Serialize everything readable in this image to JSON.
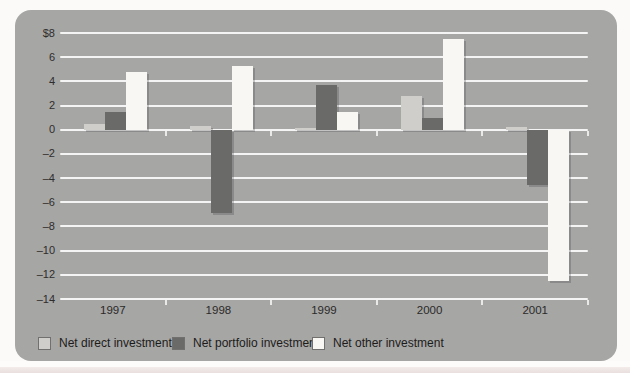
{
  "page": {
    "background": "#fbfaf9",
    "bottom_strip_color": "#e8dfde"
  },
  "panel": {
    "background": "#a6a6a5"
  },
  "chart_data": {
    "type": "bar",
    "title": "",
    "xlabel": "",
    "ylabel": "",
    "categories": [
      "1997",
      "1998",
      "1999",
      "2000",
      "2001"
    ],
    "series": [
      {
        "name": "Net direct investment",
        "color": "#cfcecb",
        "values": [
          0.5,
          0.3,
          0.1,
          2.8,
          0.2
        ]
      },
      {
        "name": "Net portfolio investment",
        "color": "#6a6a69",
        "values": [
          1.5,
          -6.9,
          3.7,
          1.0,
          -4.6
        ]
      },
      {
        "name": "Net other investment",
        "color": "#f8f7f4",
        "values": [
          4.8,
          5.3,
          1.5,
          7.5,
          -12.5
        ]
      }
    ],
    "y_axis": {
      "unit": "$ (billions implied by $8 top label)",
      "ylim": [
        -14,
        8
      ],
      "tick_step": 2,
      "gridlines": true,
      "gridline_color": "#ffffff",
      "ticks": [
        {
          "label": "$8",
          "value": 8
        },
        {
          "label": "6",
          "value": 6
        },
        {
          "label": "4",
          "value": 4
        },
        {
          "label": "2",
          "value": 2
        },
        {
          "label": "0",
          "value": 0
        },
        {
          "label": "–2",
          "value": -2
        },
        {
          "label": "–4",
          "value": -4
        },
        {
          "label": "–6",
          "value": -6
        },
        {
          "label": "–8",
          "value": -8
        },
        {
          "label": "–10",
          "value": -10
        },
        {
          "label": "–12",
          "value": -12
        },
        {
          "label": "–14",
          "value": -14
        }
      ]
    },
    "x_axis": {
      "labels": [
        "1997",
        "1998",
        "1999",
        "2000",
        "2001"
      ],
      "boundary_ticks_on_zero_line": true,
      "boundary_ticks_on_bottom_line": true
    },
    "legend": {
      "position": "bottom",
      "items": [
        "Net direct investment",
        "Net portfolio investment",
        "Net other investment"
      ]
    }
  }
}
